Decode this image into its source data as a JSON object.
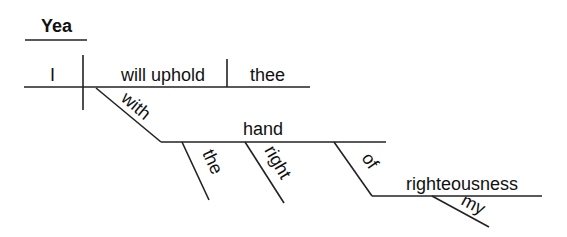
{
  "diagram": {
    "type": "sentence-diagram",
    "interjection": "Yea",
    "subject": "I",
    "verb": "will uphold",
    "object": "thee",
    "preposition_1": "with",
    "object_of_prep_1": "hand",
    "modifier_the": "the",
    "modifier_right": "right",
    "preposition_2": "of",
    "object_of_prep_2": "righteousness",
    "modifier_my": "my"
  }
}
